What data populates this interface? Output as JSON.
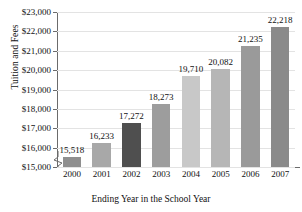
{
  "chart_data": {
    "type": "bar",
    "title": "",
    "xlabel": "Ending Year in the School Year",
    "ylabel": "Tuition and Fees",
    "categories": [
      "2000",
      "2001",
      "2002",
      "2003",
      "2004",
      "2005",
      "2006",
      "2007"
    ],
    "values": [
      15518,
      16233,
      17272,
      18273,
      19710,
      20082,
      21235,
      22218
    ],
    "value_labels": [
      "15,518",
      "16,233",
      "17,272",
      "18,273",
      "19,710",
      "20,082",
      "21,235",
      "22,218"
    ],
    "bar_colors": [
      "#8f8f8f",
      "#a8a8a8",
      "#4f4f4f",
      "#9d9d9d",
      "#c8c8c8",
      "#b6b6b6",
      "#9a9a9a",
      "#8a8a8a"
    ],
    "ylim": [
      15000,
      23000
    ],
    "yticks": [
      15000,
      16000,
      17000,
      18000,
      19000,
      20000,
      21000,
      22000,
      23000
    ],
    "ytick_labels": [
      "$15,000",
      "$16,000",
      "$17,000",
      "$18,000",
      "$19,000",
      "$20,000",
      "$21,000",
      "$22,000",
      "$23,000"
    ],
    "grid": true,
    "axis_break": true,
    "legend": "none"
  }
}
